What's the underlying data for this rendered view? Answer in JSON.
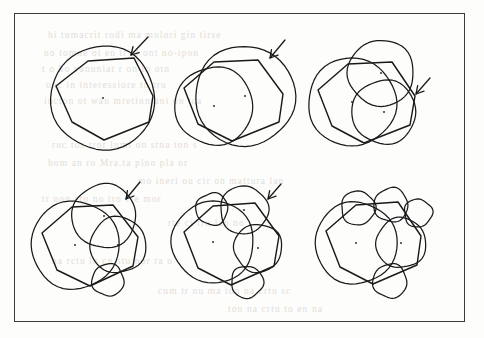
{
  "page": {
    "kind": "scanned-book-figure",
    "background_color": "#fdfdfc",
    "frame_color": "#3b3b3b",
    "ink_color": "#1a1a1a",
    "showthrough_color": "#ded9d2",
    "width": 484,
    "height": 338,
    "frame": {
      "x": 14,
      "y": 13,
      "width": 451,
      "height": 309
    }
  },
  "showthrough_lines": [
    {
      "x": 30,
      "y": 12,
      "text": "hi tumacrit rodi ma mulori gin tirse"
    },
    {
      "x": 26,
      "y": 30,
      "text": "no  tomne oi  en  tr'al  ont no-ipon"
    },
    {
      "x": 24,
      "y": 46,
      "text": "t  o  ho  vanuniat  r     on  lo  otn"
    },
    {
      "x": 28,
      "y": 62,
      "text": "onc  in   interessiore       to    tru"
    },
    {
      "x": 26,
      "y": 78,
      "text": "incton  ot  wan  mretinniani  on  tca"
    },
    {
      "x": 34,
      "y": 122,
      "text": "ruc   tos  tror  lumi  on  stna ton  s"
    },
    {
      "x": 30,
      "y": 140,
      "text": "hom  an   ro  Mra.ta    plno  pla  nr"
    },
    {
      "x": 120,
      "y": 158,
      "text": "mo ineri ou  cir on mattura  lan"
    },
    {
      "x": 24,
      "y": 176,
      "text": "tr   uon   etu  no    tro  cie    mor"
    },
    {
      "x": 150,
      "y": 200,
      "text": "rte  ci   tru  lan   no"
    },
    {
      "x": 34,
      "y": 238,
      "text": "na   rctu  lo   cn    stu   nor   ra o"
    },
    {
      "x": 140,
      "y": 268,
      "text": "cum  tr  nu  ma  ton  na  crtu  sc"
    },
    {
      "x": 210,
      "y": 286,
      "text": "ton  na   crtu  to  en  na"
    }
  ],
  "chart_data": {
    "type": "diagram",
    "title": "",
    "panel_count": 6,
    "grid": {
      "rows": 2,
      "columns": 3
    },
    "panels": [
      {
        "index": 1,
        "label": "",
        "circle_count": 1,
        "has_arrow": true,
        "arrow": {
          "tail_x": 148,
          "tail_y": 37,
          "tip_x": 131,
          "tip_y": 55
        },
        "polygon": [
          [
            134,
            58
          ],
          [
            153,
            96
          ],
          [
            149,
            122
          ],
          [
            104,
            140
          ],
          [
            72,
            122
          ],
          [
            56,
            86
          ],
          [
            88,
            61
          ]
        ],
        "circles": [
          {
            "cx": 103,
            "cy": 98,
            "r": 52,
            "center_dot": true
          }
        ]
      },
      {
        "index": 2,
        "label": "",
        "circle_count": 2,
        "has_arrow": true,
        "arrow": {
          "tail_x": 285,
          "tail_y": 40,
          "tip_x": 270,
          "tip_y": 58
        },
        "polygon": [
          [
            258,
            60
          ],
          [
            283,
            94
          ],
          [
            279,
            122
          ],
          [
            232,
            141
          ],
          [
            198,
            124
          ],
          [
            184,
            88
          ],
          [
            214,
            62
          ]
        ],
        "circles": [
          {
            "cx": 245,
            "cy": 96,
            "r": 50,
            "center_dot": true
          },
          {
            "cx": 214,
            "cy": 106,
            "r": 39,
            "center_dot": true
          }
        ]
      },
      {
        "index": 3,
        "label": "",
        "circle_count": 3,
        "has_arrow": true,
        "arrow": {
          "tail_x": 430,
          "tail_y": 78,
          "tip_x": 416,
          "tip_y": 94
        },
        "polygon": [
          [
            392,
            62
          ],
          [
            415,
            96
          ],
          [
            410,
            125
          ],
          [
            364,
            143
          ],
          [
            332,
            126
          ],
          [
            318,
            90
          ],
          [
            348,
            64
          ]
        ],
        "circles": [
          {
            "cx": 381,
            "cy": 73,
            "r": 33,
            "center_dot": true
          },
          {
            "cx": 352,
            "cy": 102,
            "r": 44,
            "center_dot": true
          },
          {
            "cx": 384,
            "cy": 112,
            "r": 32,
            "center_dot": true
          }
        ]
      },
      {
        "index": 4,
        "label": "",
        "circle_count": 4,
        "has_arrow": true,
        "arrow": {
          "tail_x": 140,
          "tail_y": 182,
          "tip_x": 126,
          "tip_y": 199
        },
        "polygon": [
          [
            113,
            205
          ],
          [
            138,
            237
          ],
          [
            133,
            266
          ],
          [
            90,
            286
          ],
          [
            57,
            270
          ],
          [
            42,
            233
          ],
          [
            72,
            207
          ]
        ],
        "circles": [
          {
            "cx": 104,
            "cy": 216,
            "r": 32,
            "center_dot": true
          },
          {
            "cx": 75,
            "cy": 245,
            "r": 44,
            "center_dot": true
          },
          {
            "cx": 118,
            "cy": 245,
            "r": 28,
            "center_dot": true
          },
          {
            "cx": 108,
            "cy": 280,
            "r": 16,
            "center_dot": false
          }
        ]
      },
      {
        "index": 5,
        "label": "",
        "circle_count": 5,
        "has_arrow": true,
        "arrow": {
          "tail_x": 281,
          "tail_y": 184,
          "tip_x": 268,
          "tip_y": 199
        },
        "polygon": [
          [
            255,
            203
          ],
          [
            279,
            236
          ],
          [
            274,
            266
          ],
          [
            231,
            285
          ],
          [
            198,
            268
          ],
          [
            184,
            232
          ],
          [
            213,
            206
          ]
        ],
        "circles": [
          {
            "cx": 244,
            "cy": 210,
            "r": 24,
            "center_dot": true
          },
          {
            "cx": 213,
            "cy": 242,
            "r": 41,
            "center_dot": true
          },
          {
            "cx": 258,
            "cy": 248,
            "r": 24,
            "center_dot": true
          },
          {
            "cx": 212,
            "cy": 209,
            "r": 16,
            "center_dot": false
          },
          {
            "cx": 247,
            "cy": 282,
            "r": 16,
            "center_dot": false
          }
        ]
      },
      {
        "index": 6,
        "label": "",
        "circle_count": 6,
        "has_arrow": false,
        "arrow": null,
        "polygon": [
          [
            398,
            202
          ],
          [
            421,
            236
          ],
          [
            417,
            265
          ],
          [
            373,
            284
          ],
          [
            340,
            267
          ],
          [
            326,
            231
          ],
          [
            356,
            205
          ]
        ],
        "circles": [
          {
            "cx": 356,
            "cy": 243,
            "r": 41,
            "center_dot": true
          },
          {
            "cx": 401,
            "cy": 243,
            "r": 25,
            "center_dot": true
          },
          {
            "cx": 358,
            "cy": 208,
            "r": 17,
            "center_dot": false
          },
          {
            "cx": 391,
            "cy": 205,
            "r": 17,
            "center_dot": false
          },
          {
            "cx": 418,
            "cy": 213,
            "r": 14,
            "center_dot": false
          },
          {
            "cx": 390,
            "cy": 281,
            "r": 17,
            "center_dot": false
          }
        ]
      }
    ]
  }
}
